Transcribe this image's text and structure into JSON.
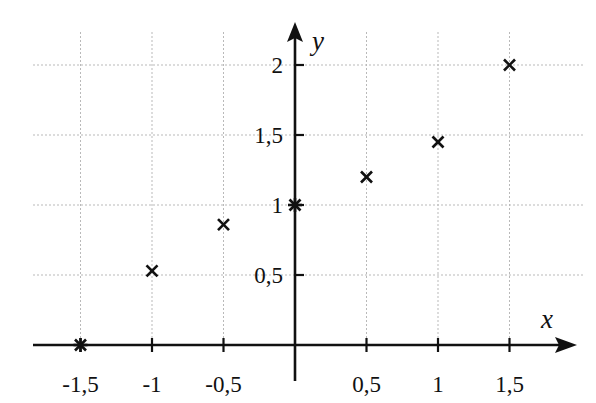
{
  "chart_data": {
    "type": "scatter",
    "title": "",
    "xlabel": "x",
    "ylabel": "y",
    "xlim": [
      -1.5,
      1.75
    ],
    "ylim": [
      0,
      2.2
    ],
    "grid": true,
    "legend": null,
    "x_ticks": [
      -1.5,
      -1,
      -0.5,
      0,
      0.5,
      1,
      1.5
    ],
    "x_tick_labels": [
      "-1,5",
      "-1",
      "-0,5",
      "",
      "0,5",
      "1",
      "1,5"
    ],
    "y_ticks": [
      0.5,
      1,
      1.5,
      2
    ],
    "y_tick_labels": [
      "0,5",
      "1",
      "1,5",
      "2"
    ],
    "series": [
      {
        "name": "points",
        "marker": "x",
        "x": [
          -1.5,
          -1,
          -0.5,
          0,
          0.5,
          1,
          1.5
        ],
        "y": [
          0,
          0.53,
          0.86,
          1,
          1.2,
          1.45,
          2
        ],
        "marker_style": [
          "asterisk",
          "cross",
          "cross",
          "asterisk",
          "cross",
          "cross",
          "cross"
        ]
      }
    ]
  },
  "colors": {
    "axis": "#111111",
    "grid": "#b9b9b9",
    "background": "#ffffff"
  }
}
